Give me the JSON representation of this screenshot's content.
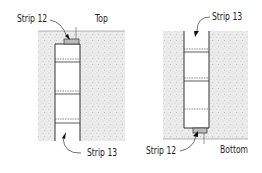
{
  "figure": {
    "left_panel": {
      "orientation_label": "Top",
      "strip_top_label": "Strip 12",
      "strip_bottom_label": "Strip 13"
    },
    "right_panel": {
      "orientation_label": "Bottom",
      "strip_top_label": "Strip 13",
      "strip_bottom_label": "Strip 12"
    }
  },
  "colors": {
    "ground": "#e6e6e6",
    "line": "#333333",
    "strip": "#555555"
  }
}
